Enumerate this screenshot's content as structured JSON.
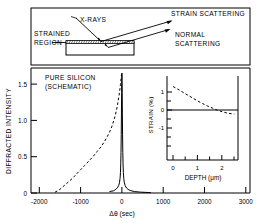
{
  "figure": {
    "top_panel": {
      "labels": {
        "xrays": "X-RAYS",
        "strained_region_line1": "STRAINED",
        "strained_region_line2": "REGION",
        "strain_scattering": "STRAIN SCATTERING",
        "normal_scattering_line1": "NORMAL",
        "normal_scattering_line2": "SCATTERING"
      }
    }
  },
  "chart_data": [
    {
      "type": "line",
      "name": "rocking-curve",
      "title": "",
      "annotation_line1": "PURE SILICON",
      "annotation_line2": "(SCHEMATIC)",
      "xlabel": "Δθ (sec)",
      "ylabel": "DIFFRACTED INTENSITY",
      "xlim": [
        -2200,
        3100
      ],
      "ylim": [
        0,
        1.72
      ],
      "xticks": [
        -2000,
        -1000,
        0,
        1000,
        2000,
        3000
      ],
      "xticklabels": [
        "-2000",
        "-1000",
        "0",
        "1000",
        "2000",
        "3000"
      ],
      "yticks": [
        0,
        0.5,
        1.0,
        1.5
      ],
      "yticklabels": [
        "0",
        "0.5",
        "1.0",
        "1.5"
      ],
      "grid": false,
      "legend": "none",
      "series": [
        {
          "name": "pure silicon (schematic)",
          "style": "solid",
          "x": [
            -300,
            -200,
            -150,
            -110,
            -80,
            -60,
            -45,
            -35,
            -28,
            -22,
            -16,
            -11,
            -7,
            -4,
            -2,
            0,
            2,
            4,
            7,
            11,
            16,
            22,
            28,
            35,
            45,
            60,
            80,
            110,
            150,
            200,
            300,
            450,
            700
          ],
          "y": [
            0.02,
            0.03,
            0.05,
            0.07,
            0.1,
            0.14,
            0.2,
            0.28,
            0.4,
            0.56,
            0.8,
            1.1,
            1.38,
            1.55,
            1.63,
            1.65,
            1.63,
            1.55,
            1.38,
            1.1,
            0.8,
            0.56,
            0.4,
            0.28,
            0.2,
            0.14,
            0.1,
            0.07,
            0.05,
            0.035,
            0.02,
            0.012,
            0.005
          ]
        },
        {
          "name": "strained layer",
          "style": "dashed",
          "x": [
            -1620,
            -1500,
            -1400,
            -1300,
            -1200,
            -1100,
            -1000,
            -900,
            -800,
            -700,
            -600,
            -500,
            -420,
            -350,
            -290,
            -240,
            -200,
            -165,
            -135,
            -110,
            -90,
            -72,
            -58,
            -46,
            -36,
            -28,
            -21,
            -15,
            -10,
            -6,
            -3,
            -1
          ],
          "y": [
            0.01,
            0.05,
            0.1,
            0.15,
            0.2,
            0.26,
            0.32,
            0.38,
            0.44,
            0.5,
            0.57,
            0.64,
            0.71,
            0.78,
            0.85,
            0.92,
            0.99,
            1.06,
            1.13,
            1.2,
            1.27,
            1.33,
            1.39,
            1.44,
            1.49,
            1.53,
            1.57,
            1.6,
            1.63,
            1.65,
            1.66,
            1.67
          ]
        }
      ]
    },
    {
      "type": "line",
      "name": "strain-depth-inset",
      "title": "",
      "xlabel": "DEPTH (μm)",
      "ylabel": "STRAIN (%)",
      "xlim": [
        -0.25,
        2.65
      ],
      "ylim": [
        -1.75,
        1.45
      ],
      "xticks": [
        0,
        0.5,
        1,
        1.5,
        2,
        2.5
      ],
      "xticklabels": [
        "0",
        "",
        "1",
        "",
        "2",
        ""
      ],
      "yticks": [
        -1,
        0,
        1
      ],
      "yticklabels": [
        "-1",
        "0",
        "1"
      ],
      "grid": false,
      "legend": "none",
      "series": [
        {
          "name": "strain profile",
          "style": "dashed",
          "x": [
            0,
            0.15,
            0.3,
            0.45,
            0.6,
            0.8,
            1.0,
            1.2,
            1.4,
            1.6,
            1.8,
            2.0,
            2.2,
            2.4,
            2.5
          ],
          "y": [
            1.05,
            0.97,
            0.89,
            0.8,
            0.72,
            0.61,
            0.5,
            0.4,
            0.31,
            0.23,
            0.15,
            0.09,
            0.04,
            0.01,
            0.0
          ]
        }
      ]
    }
  ]
}
